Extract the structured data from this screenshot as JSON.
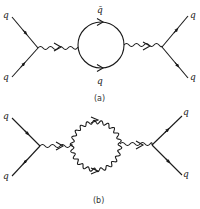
{
  "figure": {
    "panels": [
      {
        "caption": "(a)",
        "loop_type": "quark loop",
        "labels": {
          "in_top": "q",
          "in_bottom": "q",
          "loop_top": "q̄",
          "loop_bottom": "q",
          "out_top": "q",
          "out_bottom": "q"
        }
      },
      {
        "caption": "(b)",
        "loop_type": "gluon loop",
        "labels": {
          "in_top": "q",
          "in_bottom": "q",
          "out_top": "q",
          "out_bottom": "q"
        }
      }
    ],
    "colors": {
      "ink": "#1a1a1a",
      "background": "#ffffff"
    }
  }
}
